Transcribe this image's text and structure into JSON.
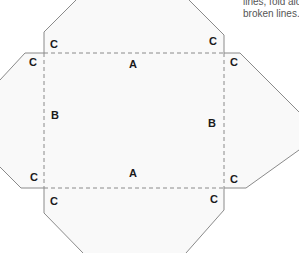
{
  "instruction_note": {
    "line1": "lines, fold along the",
    "line2": "broken lines."
  },
  "colors": {
    "fill": "#f9f9f9",
    "cut_line": "#8a8a8a",
    "fold_line": "#8a8a8a",
    "label": "#1a1a1a"
  },
  "labels": {
    "a_top": "A",
    "a_bottom": "A",
    "b_left": "B",
    "b_right": "B",
    "c_top_left_upper": "C",
    "c_top_left_side": "C",
    "c_top_right_upper": "C",
    "c_top_right_side": "C",
    "c_bottom_left_side": "C",
    "c_bottom_left_lower": "C",
    "c_bottom_right_side": "C",
    "c_bottom_right_lower": "C"
  }
}
